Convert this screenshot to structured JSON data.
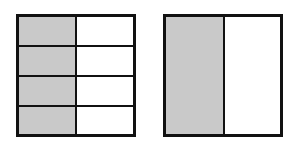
{
  "figures": [
    {
      "name": "four-eighths-square",
      "rows": 4,
      "cols": 2,
      "shaded_cells": 4,
      "total_cells": 8,
      "shade_color": "#c9c9c9"
    },
    {
      "name": "one-half-square",
      "rows": 1,
      "cols": 2,
      "shaded_cells": 1,
      "total_cells": 2,
      "shade_color": "#c9c9c9"
    }
  ]
}
